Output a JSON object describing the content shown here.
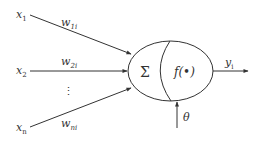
{
  "diagram": {
    "type": "artificial-neuron-model",
    "inputs": [
      {
        "label": "x",
        "sub": "1",
        "weight": "w",
        "weight_sub": "1i"
      },
      {
        "label": "x",
        "sub": "2",
        "weight": "w",
        "weight_sub": "2i"
      },
      {
        "label": "x",
        "sub": "n",
        "weight": "w",
        "weight_sub": "ni"
      }
    ],
    "ellipsis": "⋮",
    "summation_symbol": "Σ",
    "activation_label": "f(•)",
    "output": {
      "label": "y",
      "sub": "i"
    },
    "threshold": {
      "label": "θ"
    },
    "colors": {
      "stroke": "#333333",
      "background": "#ffffff"
    }
  }
}
